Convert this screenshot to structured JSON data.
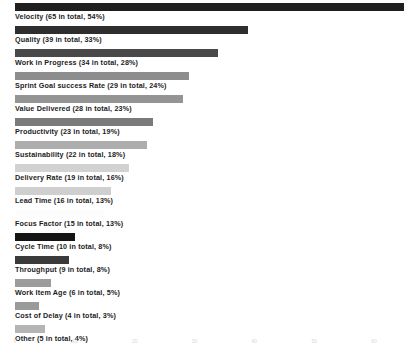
{
  "chart_data": {
    "type": "bar",
    "orientation": "horizontal",
    "title": "",
    "subtitle": "",
    "xlabel": "",
    "ylabel": "",
    "xlim": [
      0,
      65
    ],
    "grid": false,
    "legend": false,
    "axis": {
      "ticks": [
        {
          "label": "0",
          "value": 0
        },
        {
          "label": "10",
          "value": 10
        },
        {
          "label": "20",
          "value": 20
        },
        {
          "label": "30",
          "value": 30
        },
        {
          "label": "40",
          "value": 40
        },
        {
          "label": "50",
          "value": 50
        },
        {
          "label": "60",
          "value": 60
        }
      ]
    },
    "categories": [
      "Velocity",
      "Quality",
      "Work in Progress",
      "Sprint Goal success Rate",
      "Value Delivered",
      "Productivity",
      "Sustainability",
      "Delivery Rate",
      "Lead Time",
      "Focus Factor",
      "Cycle Time",
      "Throughput",
      "Work Item Age",
      "Cost of Delay",
      "Other"
    ],
    "values": [
      65,
      39,
      34,
      29,
      28,
      23,
      22,
      19,
      16,
      15,
      10,
      9,
      6,
      4,
      5
    ],
    "percents": [
      54,
      33,
      28,
      24,
      23,
      19,
      18,
      16,
      13,
      13,
      8,
      8,
      5,
      3,
      4
    ],
    "bar_colors": [
      "#1f1f1f",
      "#2e2e2e",
      "#494949",
      "#8d8d8d",
      "#949494",
      "#7b7b7b",
      "#adadad",
      "#d2d2d2",
      "#cfcfcf",
      "#fdfdfd",
      "#151515",
      "#3a3a3a",
      "#9c9c9c",
      "#9a9a9a",
      "#b4b4b4"
    ],
    "bars": [
      {
        "label": "Velocity (65 in total, 54%)",
        "category": "Velocity",
        "value": 65,
        "percent": 54,
        "color": "#1f1f1f"
      },
      {
        "label": "Quality (39 in total, 33%)",
        "category": "Quality",
        "value": 39,
        "percent": 33,
        "color": "#2e2e2e"
      },
      {
        "label": "Work in Progress (34 in total, 28%)",
        "category": "Work in Progress",
        "value": 34,
        "percent": 28,
        "color": "#494949"
      },
      {
        "label": "Sprint Goal success Rate (29 in total, 24%)",
        "category": "Sprint Goal success Rate",
        "value": 29,
        "percent": 24,
        "color": "#8d8d8d"
      },
      {
        "label": "Value Delivered (28 in total, 23%)",
        "category": "Value Delivered",
        "value": 28,
        "percent": 23,
        "color": "#949494"
      },
      {
        "label": "Productivity (23 in total, 19%)",
        "category": "Productivity",
        "value": 23,
        "percent": 19,
        "color": "#7b7b7b"
      },
      {
        "label": "Sustainability (22 in total, 18%)",
        "category": "Sustainability",
        "value": 22,
        "percent": 18,
        "color": "#adadad"
      },
      {
        "label": "Delivery Rate (19 in total, 16%)",
        "category": "Delivery Rate",
        "value": 19,
        "percent": 16,
        "color": "#d2d2d2"
      },
      {
        "label": "Lead Time (16 in total, 13%)",
        "category": "Lead Time",
        "value": 16,
        "percent": 13,
        "color": "#cfcfcf"
      },
      {
        "label": "Focus Factor (15 in total, 13%)",
        "category": "Focus Factor",
        "value": 15,
        "percent": 13,
        "color": "#fdfdfd"
      },
      {
        "label": "Cycle Time (10 in total, 8%)",
        "category": "Cycle Time",
        "value": 10,
        "percent": 8,
        "color": "#151515"
      },
      {
        "label": "Throughput (9 in total, 8%)",
        "category": "Throughput",
        "value": 9,
        "percent": 8,
        "color": "#3a3a3a"
      },
      {
        "label": "Work Item Age (6 in total, 5%)",
        "category": "Work Item Age",
        "value": 6,
        "percent": 5,
        "color": "#9c9c9c"
      },
      {
        "label": "Cost of Delay (4 in total, 3%)",
        "category": "Cost of Delay",
        "value": 4,
        "percent": 3,
        "color": "#9a9a9a"
      },
      {
        "label": "Other (5 in total, 4%)",
        "category": "Other",
        "value": 5,
        "percent": 4,
        "color": "#b4b4b4"
      }
    ]
  }
}
